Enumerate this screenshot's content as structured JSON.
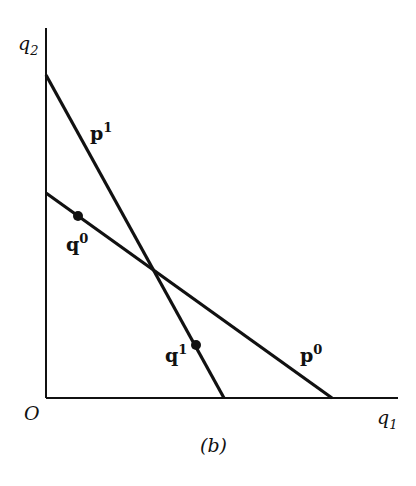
{
  "figure": {
    "caption": "(b)",
    "origin_label": "O",
    "x_axis": {
      "label": "q",
      "subscript": "1"
    },
    "y_axis": {
      "label": "q",
      "subscript": "2"
    },
    "lines": [
      {
        "id": "p1",
        "label": "p",
        "superscript": "1",
        "from": [
          46,
          75
        ],
        "to": [
          224,
          398
        ]
      },
      {
        "id": "p0",
        "label": "p",
        "superscript": "0",
        "from": [
          46,
          193
        ],
        "to": [
          332,
          398
        ]
      }
    ],
    "points": [
      {
        "id": "q0",
        "label": "q",
        "superscript": "0",
        "at": [
          78,
          216
        ]
      },
      {
        "id": "q1",
        "label": "q",
        "superscript": "1",
        "at": [
          196,
          345
        ]
      }
    ],
    "line_color": "#111111",
    "background": "#ffffff"
  }
}
